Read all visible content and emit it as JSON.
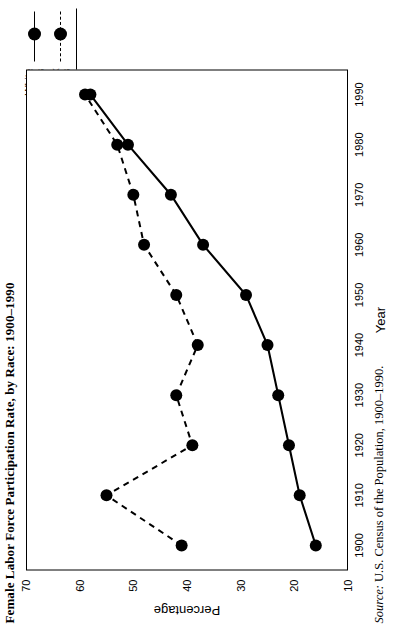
{
  "figure": {
    "title": "Female Labor Force Participation Rate, by Race: 1900–1990",
    "source_word": "Source:",
    "source_text": " U.S. Census of the Population, 1900–1990."
  },
  "legend": {
    "position": "top-right",
    "items": [
      {
        "label_line1": "White",
        "label_line2": "Females",
        "style": "solid",
        "marker": "filled-circle",
        "color": "#000000"
      },
      {
        "label_line1": "Black",
        "label_line2": "Females",
        "style": "dashed",
        "marker": "filled-circle",
        "color": "#000000"
      }
    ]
  },
  "chart_data": {
    "type": "line",
    "title": "Female Labor Force Participation Rate, by Race: 1900–1990",
    "xlabel": "Year",
    "ylabel": "Percentage",
    "x": [
      1900,
      1910,
      1920,
      1930,
      1940,
      1950,
      1960,
      1970,
      1980,
      1990
    ],
    "xticklabels": [
      "1900",
      "1910",
      "1920",
      "1930",
      "1940",
      "1950",
      "1960",
      "1970",
      "1980",
      "1990"
    ],
    "xlim": [
      1895,
      1995
    ],
    "ylim": [
      10,
      70
    ],
    "yticks": [
      10,
      20,
      30,
      40,
      50,
      60,
      70
    ],
    "yticklabels": [
      "10",
      "20",
      "30",
      "40",
      "50",
      "60",
      "70"
    ],
    "grid": false,
    "legend_position": "top-right",
    "series": [
      {
        "name": "White Females",
        "style": "solid",
        "marker": "filled-circle",
        "color": "#000000",
        "values": [
          16,
          19,
          21,
          23,
          25,
          29,
          37,
          43,
          51,
          58
        ]
      },
      {
        "name": "Black Females",
        "style": "dashed",
        "marker": "filled-circle",
        "color": "#000000",
        "values": [
          41,
          55,
          39,
          42,
          38,
          42,
          48,
          50,
          53,
          59
        ]
      }
    ]
  }
}
